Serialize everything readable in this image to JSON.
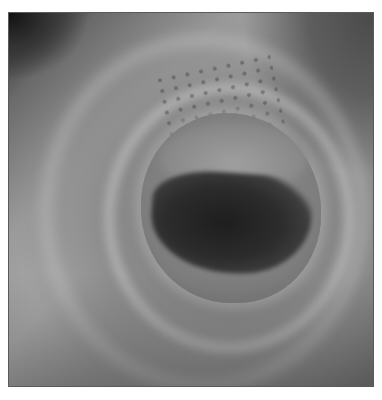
{
  "image": {
    "subject": "endoscopic view of tubular lumen",
    "colors": {
      "border": "#5a5a5a",
      "mucosa_light": "#a8a8a8",
      "mucosa_mid": "#8a8a8a",
      "lumen_dark": "#1e1e1e",
      "background": "#ffffff"
    }
  }
}
